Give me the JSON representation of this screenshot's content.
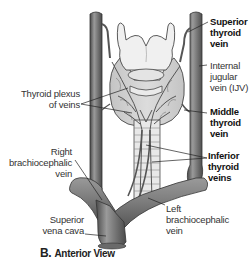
{
  "figure": {
    "caption_letter": "B.",
    "caption_text": "Anterior View",
    "colors": {
      "vein_fill": "#7b7b7b",
      "vein_dark": "#4a4a4a",
      "vein_highlight": "#a8a8a8",
      "cartilage_fill": "#f0f0f0",
      "gland_fill": "#d6d6d6",
      "trachea_fill": "#e8e8e8",
      "outline": "#333333",
      "leader_line": "#222222"
    }
  },
  "labels": {
    "superior_thyroid_vein": [
      "Superior",
      "thyroid",
      "vein"
    ],
    "internal_jugular_vein": [
      "Internal",
      "jugular",
      "vein (IJV)"
    ],
    "thyroid_plexus": [
      "Thyroid plexus",
      "of veins"
    ],
    "middle_thyroid_vein": [
      "Middle",
      "thyroid",
      "vein"
    ],
    "inferior_thyroid_veins": [
      "Inferior",
      "thyroid",
      "veins"
    ],
    "right_brachiocephalic_vein": [
      "Right",
      "brachiocephalic",
      "vein"
    ],
    "superior_vena_cava": [
      "Superior",
      "vena cava"
    ],
    "left_brachiocephalic_vein": [
      "Left",
      "brachiocephalic",
      "vein"
    ]
  }
}
